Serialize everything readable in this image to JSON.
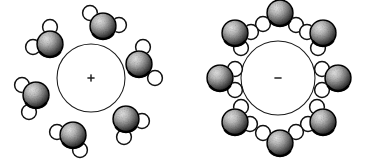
{
  "figure": {
    "width": 367,
    "height": 163,
    "background_color": "#ffffff",
    "line_color": "#1a1a1a",
    "oxygen_color": "#3a3a3a",
    "hydrogen_color": "#ffffff"
  },
  "panels": [
    {
      "id": "cation-panel",
      "name": "cation-hydration-shell",
      "ion": {
        "charge_symbol": "+",
        "charge_name": "positive",
        "center_x": 91,
        "center_y": 78,
        "radius": 34
      },
      "water_count": 6,
      "orientation_note": "oxygen atoms face the ion",
      "molecules": [
        {
          "label": "water-upper-left",
          "ox": 50,
          "oy": 44,
          "h1x": 50,
          "h1y": 27,
          "h2x": 33,
          "h2y": 47
        },
        {
          "label": "water-top",
          "ox": 103,
          "oy": 26,
          "h1x": 90,
          "h1y": 13,
          "h2x": 119,
          "h2y": 25
        },
        {
          "label": "water-right",
          "ox": 139,
          "oy": 64,
          "h1x": 143,
          "h1y": 47,
          "h2x": 155,
          "h2y": 78
        },
        {
          "label": "water-left",
          "ox": 36,
          "oy": 95,
          "h1x": 22,
          "h1y": 85,
          "h2x": 29,
          "h2y": 112
        },
        {
          "label": "water-lower-right",
          "ox": 126,
          "oy": 119,
          "h1x": 142,
          "h1y": 121,
          "h2x": 124,
          "h2y": 137
        },
        {
          "label": "water-bottom",
          "ox": 73,
          "oy": 135,
          "h1x": 57,
          "h1y": 132,
          "h2x": 80,
          "h2y": 150
        }
      ]
    },
    {
      "id": "anion-panel",
      "name": "anion-hydration-shell",
      "ion": {
        "charge_symbol": "−",
        "charge_name": "negative",
        "center_x": 278,
        "center_y": 78,
        "radius": 37
      },
      "water_count": 8,
      "orientation_note": "hydrogen atoms face the ion",
      "molecules": [
        {
          "label": "water-top",
          "ox": 280,
          "oy": 13,
          "h1x": 263,
          "h1y": 24,
          "h2x": 296,
          "h2y": 25
        },
        {
          "label": "water-upper-right",
          "ox": 323,
          "oy": 33,
          "h1x": 307,
          "h1y": 32,
          "h2x": 318,
          "h2y": 48
        },
        {
          "label": "water-right",
          "ox": 338,
          "oy": 78,
          "h1x": 322,
          "h1y": 69,
          "h2x": 322,
          "h2y": 90
        },
        {
          "label": "water-lower-right",
          "ox": 323,
          "oy": 122,
          "h1x": 308,
          "h1y": 124,
          "h2x": 317,
          "h2y": 107
        },
        {
          "label": "water-bottom",
          "ox": 280,
          "oy": 143,
          "h1x": 263,
          "h1y": 133,
          "h2x": 296,
          "h2y": 132
        },
        {
          "label": "water-lower-left",
          "ox": 235,
          "oy": 122,
          "h1x": 250,
          "h1y": 124,
          "h2x": 241,
          "h2y": 107
        },
        {
          "label": "water-left",
          "ox": 220,
          "oy": 78,
          "h1x": 235,
          "h1y": 69,
          "h2x": 235,
          "h2y": 90
        },
        {
          "label": "water-upper-left",
          "ox": 235,
          "oy": 33,
          "h1x": 251,
          "h1y": 32,
          "h2x": 241,
          "h2y": 48
        }
      ]
    }
  ]
}
